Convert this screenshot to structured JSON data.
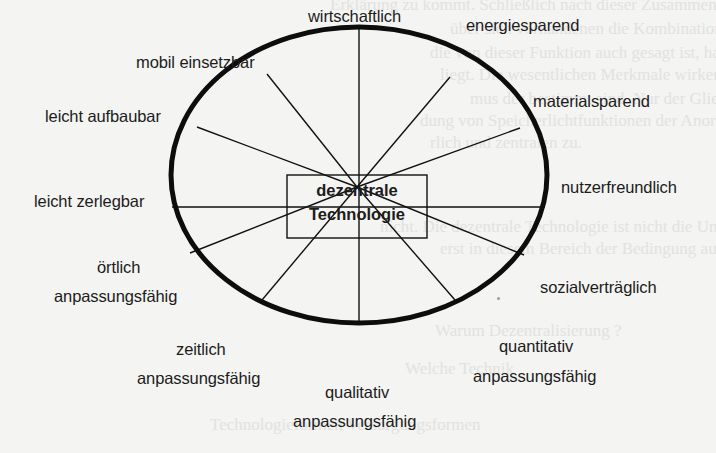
{
  "diagram": {
    "center": {
      "line1": "dezentrale",
      "line2": "Technologie"
    },
    "attributes": [
      {
        "id": "wirtschaftlich",
        "text": "wirtschaftlich"
      },
      {
        "id": "energiesparend",
        "text": "energiesparend"
      },
      {
        "id": "materialsparend",
        "text": "materialsparend"
      },
      {
        "id": "nutzerfreundlich",
        "text": "nutzerfreundlich"
      },
      {
        "id": "sozialvertraeglich",
        "text": "sozialverträglich"
      },
      {
        "id": "quantitativ",
        "line1": "quantitativ",
        "line2": "anpassungsfähig"
      },
      {
        "id": "qualitativ",
        "line1": "qualitativ",
        "line2": "anpassungsfähig"
      },
      {
        "id": "zeitlich",
        "line1": "zeitlich",
        "line2": "anpassungsfähig"
      },
      {
        "id": "oertlich",
        "line1": "örtlich",
        "line2": "anpassungsfähig"
      },
      {
        "id": "leicht-zerlegbar",
        "text": "leicht zerlegbar"
      },
      {
        "id": "leicht-aufbaubar",
        "text": "leicht aufbaubar"
      },
      {
        "id": "mobil-einsetzbar",
        "text": "mobil einsetzbar"
      }
    ],
    "colors": {
      "background": "#f4f4f2",
      "stroke": "#111111",
      "text": "#1c1c1c",
      "bleed_through": "#e2e2e0"
    }
  },
  "bleed_through_text": [
    "Erklärung zu kommt. Schließlich nach dieser Zusammenhang zu ermitteln",
    "über sich vorhandenen die Kombination, die sich weitergehend",
    "die von dieser Funktion auch gesagt ist, hat so Vorteile gemacht.",
    "liegt. Die wesentlichen Merkmale wirken, die weitergehend",
    "mus der bestimmt sind. Nur der Gliederung werden die",
    "dung von Speicherlichtfunktionen der Anordnung des Nutzers",
    "rlich und zentralen zu.",
    "nicht. Die dezentrale Technologie ist nicht die Umsetzung",
    "erst in diesem Bereich der Bedingung ausgeführt.",
    "Warum Dezentralisierung ?",
    "Welche Technik",
    "Technologieformen              Versorgungsformen"
  ]
}
